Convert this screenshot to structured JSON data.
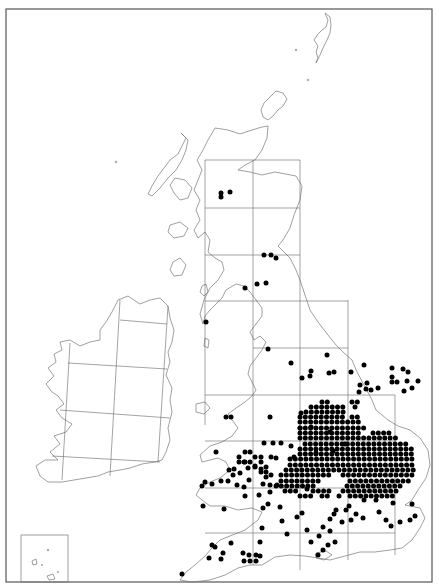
{
  "map": {
    "type": "distribution-dot-map",
    "region": "Britain and Ireland",
    "colors": {
      "dot": "#000000",
      "coast": "#777777",
      "grid": "#666666",
      "frame": "#555555",
      "background": "#ffffff"
    },
    "frame": {
      "x": 6,
      "y": 9,
      "w": 426,
      "h": 573
    },
    "inset_box": {
      "x": 21,
      "y": 535,
      "w": 47,
      "h": 47
    },
    "dot_radius": 2.5,
    "lattice_step": 5.3,
    "gb_grid": {
      "vertical_x": [
        205,
        253,
        300,
        348,
        395
      ],
      "horizontal_y": [
        160,
        208,
        255,
        301,
        348,
        395,
        441,
        488,
        533
      ]
    },
    "scattered_dots": [
      [
        221,
        193
      ],
      [
        221,
        197
      ],
      [
        230,
        192
      ],
      [
        276,
        258
      ],
      [
        266,
        283
      ],
      [
        257,
        284
      ],
      [
        245,
        288
      ],
      [
        264,
        255
      ],
      [
        271,
        255
      ],
      [
        206,
        322
      ],
      [
        268,
        349
      ],
      [
        291,
        363
      ],
      [
        327,
        355
      ],
      [
        329,
        373
      ],
      [
        334,
        372
      ],
      [
        311,
        371
      ],
      [
        310,
        376
      ],
      [
        302,
        378
      ],
      [
        351,
        372
      ],
      [
        364,
        365
      ],
      [
        392,
        377
      ],
      [
        392,
        368
      ],
      [
        360,
        385
      ],
      [
        367,
        383
      ],
      [
        371,
        390
      ],
      [
        378,
        388
      ],
      [
        366,
        389
      ],
      [
        359,
        392
      ],
      [
        392,
        382
      ],
      [
        397,
        382
      ],
      [
        404,
        391
      ],
      [
        407,
        381
      ],
      [
        403,
        369
      ],
      [
        408,
        372
      ],
      [
        418,
        381
      ],
      [
        412,
        388
      ],
      [
        270,
        417
      ],
      [
        301,
        413
      ],
      [
        300,
        428
      ],
      [
        264,
        443
      ],
      [
        273,
        443
      ],
      [
        276,
        458
      ],
      [
        291,
        446
      ],
      [
        294,
        457
      ],
      [
        281,
        443
      ],
      [
        311,
        427
      ],
      [
        316,
        453
      ],
      [
        330,
        432
      ],
      [
        345,
        444
      ],
      [
        333,
        451
      ],
      [
        226,
        417
      ],
      [
        231,
        417
      ],
      [
        271,
        457
      ],
      [
        248,
        468
      ],
      [
        255,
        466
      ],
      [
        261,
        469
      ],
      [
        266,
        477
      ],
      [
        270,
        485
      ],
      [
        277,
        485
      ],
      [
        249,
        480
      ],
      [
        240,
        473
      ],
      [
        229,
        470
      ],
      [
        233,
        475
      ],
      [
        221,
        481
      ],
      [
        228,
        481
      ],
      [
        212,
        484
      ],
      [
        205,
        482
      ],
      [
        234,
        469
      ],
      [
        244,
        462
      ],
      [
        216,
        452
      ],
      [
        271,
        475
      ],
      [
        263,
        484
      ],
      [
        270,
        492
      ],
      [
        259,
        495
      ],
      [
        245,
        496
      ],
      [
        237,
        485
      ],
      [
        244,
        487
      ],
      [
        202,
        486
      ],
      [
        203,
        506
      ],
      [
        268,
        504
      ],
      [
        224,
        509
      ],
      [
        212,
        545
      ],
      [
        182,
        574
      ],
      [
        209,
        558
      ],
      [
        215,
        547
      ],
      [
        223,
        553
      ],
      [
        221,
        559
      ],
      [
        231,
        543
      ],
      [
        243,
        553
      ],
      [
        244,
        561
      ],
      [
        249,
        555
      ],
      [
        256,
        555
      ],
      [
        250,
        561
      ],
      [
        256,
        561
      ],
      [
        262,
        528
      ],
      [
        260,
        542
      ],
      [
        260,
        556
      ],
      [
        297,
        517
      ],
      [
        263,
        508
      ],
      [
        280,
        507
      ],
      [
        282,
        521
      ],
      [
        287,
        534
      ],
      [
        307,
        489
      ],
      [
        302,
        513
      ],
      [
        307,
        530
      ],
      [
        311,
        542
      ],
      [
        319,
        536
      ],
      [
        330,
        531
      ],
      [
        323,
        527
      ],
      [
        330,
        519
      ],
      [
        336,
        510
      ],
      [
        339,
        496
      ],
      [
        334,
        514
      ],
      [
        342,
        522
      ],
      [
        349,
        506
      ],
      [
        356,
        514
      ],
      [
        363,
        518
      ],
      [
        351,
        520
      ],
      [
        346,
        510
      ],
      [
        364,
        500
      ],
      [
        376,
        500
      ],
      [
        379,
        512
      ],
      [
        386,
        520
      ],
      [
        393,
        503
      ],
      [
        391,
        526
      ],
      [
        412,
        504
      ],
      [
        400,
        522
      ],
      [
        410,
        520
      ],
      [
        415,
        516
      ],
      [
        328,
        545
      ],
      [
        323,
        550
      ],
      [
        318,
        555
      ],
      [
        335,
        542
      ]
    ],
    "dense_rows": [
      {
        "y": 402,
        "runs": [
          [
            322,
            332
          ],
          [
            352,
            358
          ]
        ]
      },
      {
        "y": 407,
        "runs": [
          [
            311,
            343
          ],
          [
            355,
            358
          ]
        ]
      },
      {
        "y": 412,
        "runs": [
          [
            306,
            345
          ]
        ]
      },
      {
        "y": 417,
        "runs": [
          [
            300,
            345
          ],
          [
            352,
            358
          ]
        ]
      },
      {
        "y": 422,
        "runs": [
          [
            300,
            362
          ]
        ]
      },
      {
        "y": 428,
        "runs": [
          [
            300,
            365
          ]
        ]
      },
      {
        "y": 433,
        "runs": [
          [
            300,
            362
          ],
          [
            373,
            394
          ]
        ]
      },
      {
        "y": 438,
        "runs": [
          [
            300,
            398
          ]
        ]
      },
      {
        "y": 444,
        "runs": [
          [
            305,
            406
          ]
        ]
      },
      {
        "y": 449,
        "runs": [
          [
            300,
            412
          ]
        ]
      },
      {
        "y": 454,
        "runs": [
          [
            300,
            412
          ]
        ]
      },
      {
        "y": 459,
        "runs": [
          [
            290,
            416
          ]
        ]
      },
      {
        "y": 465,
        "runs": [
          [
            290,
            416
          ]
        ]
      },
      {
        "y": 470,
        "runs": [
          [
            286,
            416
          ]
        ]
      },
      {
        "y": 475,
        "runs": [
          [
            281,
            330
          ],
          [
            343,
            412
          ]
        ]
      },
      {
        "y": 481,
        "runs": [
          [
            281,
            322
          ],
          [
            350,
            410
          ]
        ]
      },
      {
        "y": 486,
        "runs": [
          [
            276,
            318
          ],
          [
            347,
            405
          ]
        ]
      },
      {
        "y": 491,
        "runs": [
          [
            285,
            300
          ],
          [
            313,
            330
          ],
          [
            343,
            400
          ]
        ]
      },
      {
        "y": 496,
        "runs": [
          [
            300,
            312
          ],
          [
            322,
            330
          ],
          [
            350,
            395
          ]
        ]
      }
    ],
    "dense_cluster_wales": [
      [
        239,
        462
      ],
      [
        245,
        462
      ],
      [
        250,
        462
      ],
      [
        239,
        457
      ],
      [
        245,
        452
      ],
      [
        250,
        452
      ],
      [
        255,
        457
      ],
      [
        261,
        457
      ],
      [
        261,
        462
      ],
      [
        255,
        467
      ],
      [
        266,
        467
      ],
      [
        266,
        472
      ],
      [
        261,
        472
      ]
    ]
  }
}
